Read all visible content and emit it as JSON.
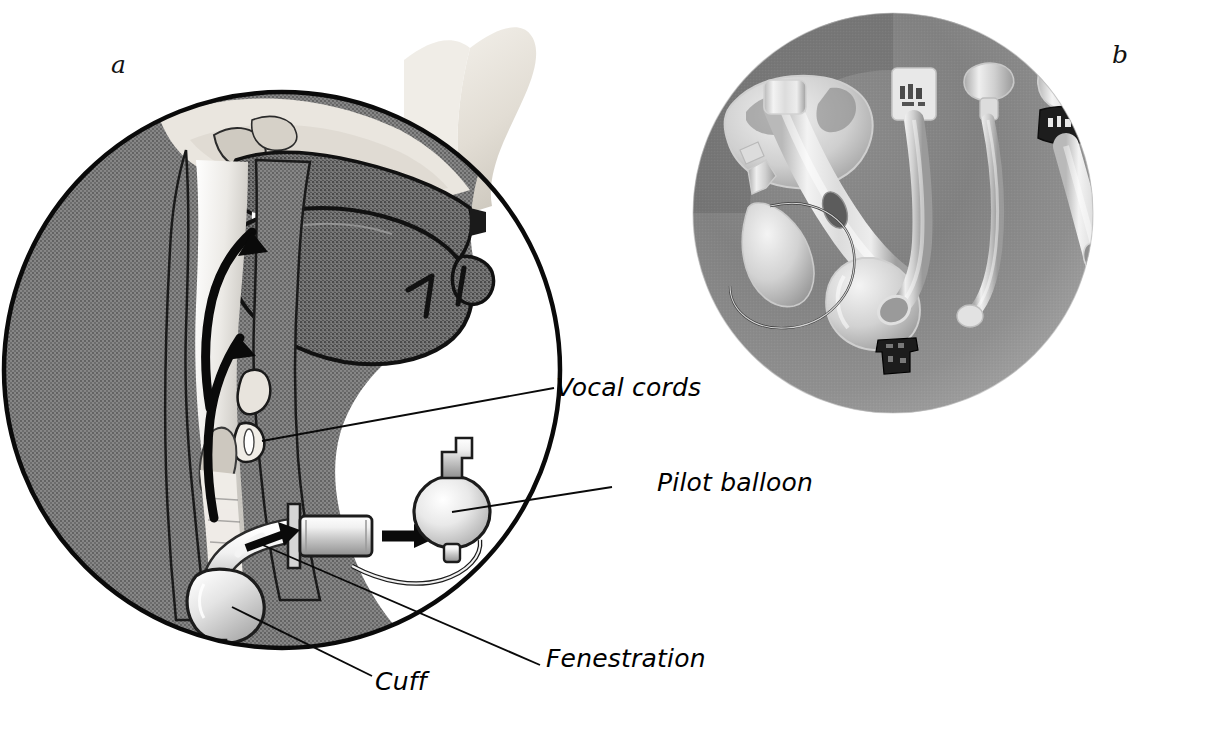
{
  "figure": {
    "type": "medical-illustration",
    "panels": [
      {
        "id": "a",
        "letter": "a",
        "kind": "line-drawing",
        "description": "Sagittal section of head and neck showing a cuffed fenestrated tracheostomy tube in place"
      },
      {
        "id": "b",
        "letter": "b",
        "kind": "photograph",
        "description": "Circular photograph of tracheostomy tube components on a grey background"
      }
    ],
    "callouts": [
      {
        "id": "vocal-cords",
        "text": "Vocal cords"
      },
      {
        "id": "pilot-balloon",
        "text": "Pilot balloon"
      },
      {
        "id": "fenestration",
        "text": "Fenestration"
      },
      {
        "id": "cuff",
        "text": "Cuff"
      }
    ],
    "colors": {
      "background": "#ffffff",
      "ink": "#000000",
      "tissue_dark": "#707070",
      "tissue_mid": "#9a9a9a",
      "tissue_light": "#d8d4cf",
      "bone": "#ded9d2",
      "photo_background": "#8e8e8e",
      "photo_background_dark": "#6f6f6f",
      "device_plastic": "#e6e6e6"
    }
  }
}
